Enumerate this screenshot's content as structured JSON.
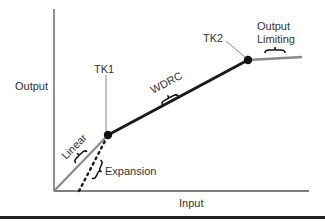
{
  "diagram": {
    "type": "input-output compression curve",
    "axes": {
      "x_label": "Input",
      "y_label": "Output"
    },
    "kneepoints": [
      {
        "id": "tk1",
        "label": "TK1"
      },
      {
        "id": "tk2",
        "label": "TK2"
      }
    ],
    "regions": {
      "linear": "Linear",
      "expansion": "Expansion",
      "wdrc": "WDRC",
      "output_limiting_line1": "Output",
      "output_limiting_line2": "Limiting"
    },
    "colors": {
      "axis": "#555555",
      "linear_line": "#8a8a8a",
      "wdrc_line": "#1a1a1a",
      "limiting_line": "#8a8a8a",
      "expansion_dots": "#1a1a1a",
      "kneepoint": "#111111",
      "bottom_rule": "#222222"
    }
  }
}
